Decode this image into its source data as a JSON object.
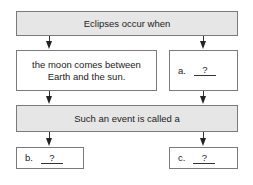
{
  "diagram": {
    "top_box": {
      "text": "Eclipses occur when"
    },
    "left_middle_box": {
      "text": "the moon comes between Earth and the sun."
    },
    "right_middle_box": {
      "label": "a.",
      "blank": "?"
    },
    "middle_box": {
      "text": "Such an event is called a"
    },
    "bottom_left_box": {
      "label": "b.",
      "blank": "?"
    },
    "bottom_right_box": {
      "label": "c.",
      "blank": "?"
    },
    "colors": {
      "shaded_fill": "#e6e6e6",
      "border": "#7a7a7a",
      "arrow": "#222222"
    }
  }
}
